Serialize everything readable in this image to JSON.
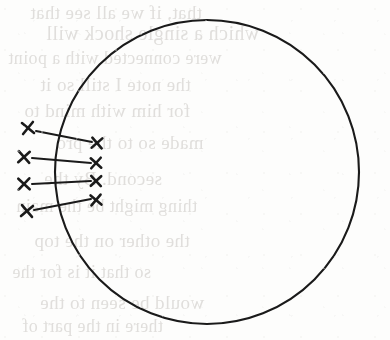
{
  "figure": {
    "medium": "scanned book page",
    "background_color": "#fdfdfc",
    "ink_color": "#1a1a1a",
    "ghost_text_color": "#c9c6c2"
  },
  "circle": {
    "name": "large-circle",
    "center_x": 207,
    "center_y": 172,
    "radius": 152,
    "stroke_width": 2.1,
    "stroke_color": "#1a1a1a",
    "fill": "none"
  },
  "outer_marks": {
    "label": "outer cross marks (left of circle)",
    "count": 4,
    "size": 11,
    "stroke_width": 2.6,
    "points": [
      {
        "id": "L1",
        "x": 28,
        "y": 128
      },
      {
        "id": "L2",
        "x": 24,
        "y": 157
      },
      {
        "id": "L3",
        "x": 24,
        "y": 184
      },
      {
        "id": "L4",
        "x": 27,
        "y": 211
      }
    ]
  },
  "inner_marks": {
    "label": "inner cross marks (inside circle)",
    "count": 4,
    "size": 10,
    "stroke_width": 2.6,
    "points": [
      {
        "id": "R1",
        "x": 97,
        "y": 143
      },
      {
        "id": "R2",
        "x": 96,
        "y": 163
      },
      {
        "id": "R3",
        "x": 96,
        "y": 181
      },
      {
        "id": "R4",
        "x": 96,
        "y": 200
      }
    ]
  },
  "connectors": {
    "label": "ray lines joining outer to inner marks",
    "count": 4,
    "stroke_width": 2.0,
    "lines": [
      {
        "id": "ray-1",
        "from": "L1",
        "to": "R1",
        "x1": 36,
        "y1": 131,
        "x2": 92,
        "y2": 142
      },
      {
        "id": "ray-2",
        "from": "L2",
        "to": "R2",
        "x1": 32,
        "y1": 158,
        "x2": 91,
        "y2": 163
      },
      {
        "id": "ray-3",
        "from": "L3",
        "to": "R3",
        "x1": 32,
        "y1": 184,
        "x2": 91,
        "y2": 181
      },
      {
        "id": "ray-4",
        "from": "L4",
        "to": "R4",
        "x1": 34,
        "y1": 210,
        "x2": 91,
        "y2": 199
      }
    ]
  },
  "ghost_text": {
    "description": "faint mirrored bleed-through text from reverse of page",
    "lines": [
      {
        "text": "that, if we all see that",
        "x": 30,
        "y": 2,
        "size": 19
      },
      {
        "text": "which a single shock will",
        "x": 46,
        "y": 22,
        "size": 20
      },
      {
        "text": "were connected with a point",
        "x": 8,
        "y": 48,
        "size": 18
      },
      {
        "text": "the note I still so it",
        "x": 40,
        "y": 74,
        "size": 19
      },
      {
        "text": "for him with mind to",
        "x": 24,
        "y": 100,
        "size": 19
      },
      {
        "text": "made so to the pro",
        "x": 56,
        "y": 132,
        "size": 19
      },
      {
        "text": "second. By the",
        "x": 44,
        "y": 168,
        "size": 19
      },
      {
        "text": "thing might be the main",
        "x": 16,
        "y": 196,
        "size": 18
      },
      {
        "text": "the other on the top",
        "x": 34,
        "y": 230,
        "size": 19
      },
      {
        "text": "so that it is for the",
        "x": 12,
        "y": 262,
        "size": 18
      },
      {
        "text": "would be seen to the",
        "x": 40,
        "y": 292,
        "size": 19
      },
      {
        "text": "there in the part of",
        "x": 22,
        "y": 316,
        "size": 18
      }
    ]
  }
}
